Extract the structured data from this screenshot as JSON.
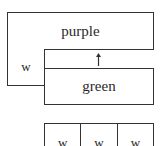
{
  "diagram": {
    "blocks": {
      "top": {
        "label": "purple"
      },
      "left_small": {
        "label": "w"
      },
      "lower": {
        "label": "green"
      }
    },
    "arrow": {
      "direction": "up",
      "from": "green",
      "to": "purple"
    },
    "bottom_row": {
      "cells": [
        {
          "label": "w"
        },
        {
          "label": "w"
        },
        {
          "label": "w"
        }
      ]
    }
  }
}
